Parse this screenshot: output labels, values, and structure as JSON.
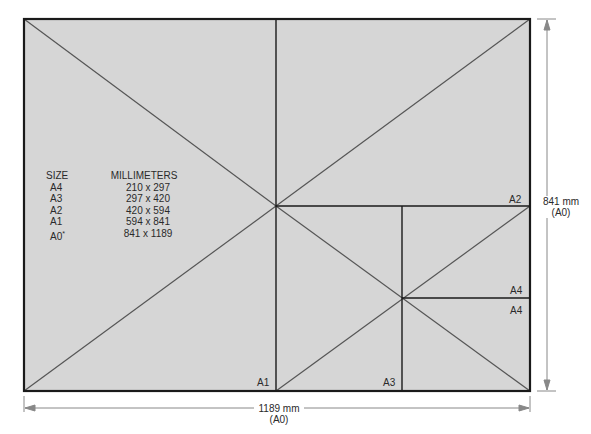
{
  "diagram": {
    "colors": {
      "sheet_fill": "#d6d6d6",
      "border": "#1a1a1a",
      "diagonal": "#555555",
      "dimension_line": "#888888"
    },
    "table": {
      "headers": [
        "SIZE",
        "MILLIMETERS"
      ],
      "rows": [
        {
          "size": "A4",
          "mm": "210 x 297"
        },
        {
          "size": "A3",
          "mm": "297 x 420"
        },
        {
          "size": "A2",
          "mm": "420 x 594"
        },
        {
          "size": "A1",
          "mm": "594 x 841"
        },
        {
          "size": "A0",
          "asterisk": "*",
          "mm": "841 x 1189"
        }
      ]
    },
    "region_labels": {
      "a1": "A1",
      "a2": "A2",
      "a3": "A3",
      "a4_upper": "A4",
      "a4_lower": "A4"
    },
    "dimensions": {
      "height": {
        "value": "841 mm",
        "sub": "(A0)"
      },
      "width": {
        "value": "1189 mm",
        "sub": "(A0)"
      }
    }
  }
}
